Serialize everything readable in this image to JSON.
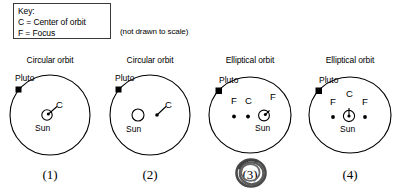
{
  "key": {
    "name": "orbit-key",
    "title": "Key:",
    "lines": [
      "Key:",
      "C = Center of orbit",
      "F = Focus"
    ],
    "center_label": "C = Center of orbit",
    "focus_label": "F = Focus"
  },
  "note": "(not drawn to scale)",
  "labels": {
    "pluto": "Pluto",
    "sun": "Sun",
    "center": "C",
    "focus": "F"
  },
  "colors": {
    "ink": "#000000",
    "box_border": "#3a3a3a",
    "answer_mark": "#4a4a4a"
  },
  "answer": {
    "marked_choice": "(3)",
    "mark_type": "hand-drawn-circle"
  },
  "choices": [
    {
      "id": "choice-1",
      "number": "(1)",
      "title": "Circular orbit",
      "orbit_shape": "circle",
      "pluto_label": "Pluto",
      "sun_label": "Sun",
      "points": [
        {
          "symbol": "C",
          "role": "center",
          "marker": "sun-with-dot",
          "leader": true
        }
      ]
    },
    {
      "id": "choice-2",
      "number": "(2)",
      "title": "Circular orbit",
      "orbit_shape": "circle",
      "pluto_label": "Pluto",
      "sun_label": "Sun",
      "points": [
        {
          "symbol": "C",
          "role": "center",
          "marker": "dot",
          "leader": true
        }
      ]
    },
    {
      "id": "choice-3",
      "number": "(3)",
      "title": "Elliptical orbit",
      "orbit_shape": "ellipse",
      "pluto_label": "Pluto",
      "sun_label": "Sun",
      "points": [
        {
          "symbol": "F",
          "role": "focus-left",
          "marker": "dot",
          "leader": false
        },
        {
          "symbol": "C",
          "role": "center",
          "marker": "dot",
          "leader": false
        },
        {
          "symbol": "F",
          "role": "focus-right",
          "marker": "sun-with-dot",
          "leader": false
        }
      ]
    },
    {
      "id": "choice-4",
      "number": "(4)",
      "title": "Elliptical orbit",
      "orbit_shape": "ellipse",
      "pluto_label": "Pluto",
      "sun_label": "Sun",
      "points": [
        {
          "symbol": "F",
          "role": "focus-left",
          "marker": "dot",
          "leader": false
        },
        {
          "symbol": "C",
          "role": "center",
          "marker": "sun-with-dot",
          "leader": false
        },
        {
          "symbol": "F",
          "role": "focus-right",
          "marker": "dot",
          "leader": false
        }
      ]
    }
  ]
}
